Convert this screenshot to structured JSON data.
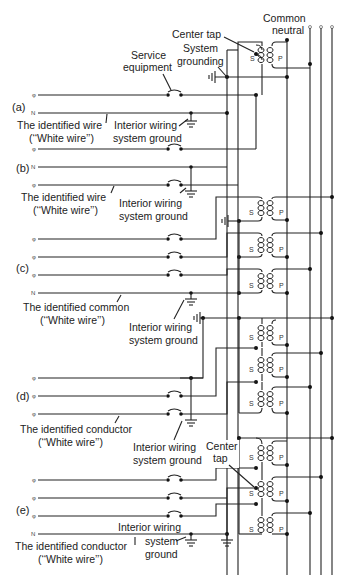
{
  "diagram": {
    "top_labels": {
      "common_neutral": [
        "Common",
        "neutral"
      ],
      "center_tap": "Center tap",
      "system_grounding": [
        "System",
        "grounding"
      ],
      "service_equipment": [
        "Service",
        "equipment"
      ]
    },
    "sections": [
      {
        "id": "a",
        "tag": "(a)",
        "wires": [
          "φ",
          "N"
        ],
        "labels": {
          "identified": [
            "The identified wire",
            "(‘‘White wire’’)"
          ],
          "ground": [
            "Interior wiring",
            "system ground"
          ]
        }
      },
      {
        "id": "b",
        "tag": "(b)",
        "wires": [
          "φ",
          "N",
          "φ"
        ],
        "labels": {
          "identified": [
            "The identified wire",
            "(‘‘White wire’’)"
          ],
          "ground": [
            "Interior wiring",
            "system ground"
          ]
        }
      },
      {
        "id": "c",
        "tag": "(c)",
        "wires": [
          "φ",
          "φ",
          "φ",
          "N"
        ],
        "labels": {
          "identified": [
            "The identified common",
            "(‘‘White wire’’)"
          ],
          "ground": [
            "Interior wiring",
            "system ground"
          ]
        }
      },
      {
        "id": "d",
        "tag": "(d)",
        "wires": [
          "φ",
          "φ",
          "φ"
        ],
        "labels": {
          "identified": [
            "The identified conductor",
            "(‘‘White wire’’)"
          ],
          "ground": [
            "Interior wiring",
            "system ground"
          ]
        }
      },
      {
        "id": "e",
        "tag": "(e)",
        "wires": [
          "φ",
          "φ",
          "φ",
          "N"
        ],
        "labels": {
          "center_tap": [
            "Center",
            "tap"
          ],
          "identified": [
            "The identified conductor",
            "(‘‘White wire’’)"
          ],
          "ground": [
            "Interior wiring",
            "system",
            "ground"
          ]
        }
      }
    ],
    "coil_labels": {
      "secondary": "S",
      "primary": "P"
    },
    "wire_symbols": {
      "phase": "φ",
      "neutral": "N"
    }
  }
}
